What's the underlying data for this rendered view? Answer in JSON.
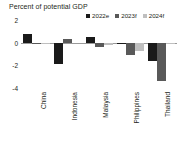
{
  "chart_data": {
    "type": "bar",
    "title": "Percent of potential GDP",
    "xlabel": "",
    "ylabel": "",
    "ylim": [
      -4,
      2
    ],
    "yticks": [
      2,
      0,
      -2,
      -4
    ],
    "ytick_labels": [
      "2",
      "0",
      "-2",
      "-4"
    ],
    "grid": false,
    "legend_position": "top-right",
    "categories": [
      "China",
      "Indonesia",
      "Malaysia",
      "Philippines",
      "Thailand"
    ],
    "series": [
      {
        "name": "2022e",
        "color": "#1a1a1a",
        "values": [
          0.8,
          -1.9,
          0.5,
          -0.1,
          -1.6
        ]
      },
      {
        "name": "2023f",
        "color": "#595959",
        "values": [
          -0.15,
          0.35,
          -0.4,
          -1.1,
          -3.4
        ]
      },
      {
        "name": "2024f",
        "color": "#bfbfbf",
        "values": [
          -0.1,
          0.0,
          -0.2,
          -0.75,
          -0.05
        ]
      }
    ]
  },
  "chart": {
    "title": "Percent of potential GDP",
    "zero_line_color": "#9a9a9a",
    "background": "#ffffff",
    "text_color": "#231f20"
  },
  "legend": {
    "items": [
      {
        "label": "2022e",
        "color": "#1a1a1a"
      },
      {
        "label": "2023f",
        "color": "#595959"
      },
      {
        "label": "2024f",
        "color": "#bfbfbf"
      }
    ]
  },
  "yaxis": {
    "ticks": [
      {
        "label": "2",
        "value": 2
      },
      {
        "label": "0",
        "value": 0
      },
      {
        "label": "-2",
        "value": -2
      },
      {
        "label": "-4",
        "value": -4
      }
    ]
  },
  "xaxis": {
    "categories": [
      {
        "label": "China"
      },
      {
        "label": "Indonesia"
      },
      {
        "label": "Malaysia"
      },
      {
        "label": "Philippines"
      },
      {
        "label": "Thailand"
      }
    ]
  }
}
